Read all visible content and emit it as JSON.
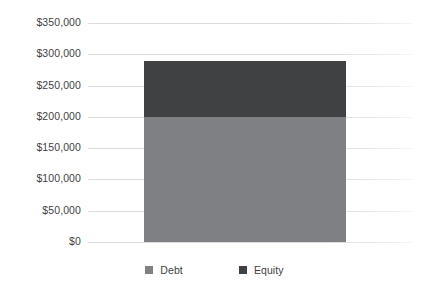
{
  "chart_data": {
    "type": "bar",
    "subtype": "stacked-bar",
    "title": "",
    "xlabel": "",
    "ylabel": "",
    "categories": [
      ""
    ],
    "series": [
      {
        "name": "Debt",
        "values": [
          200000
        ],
        "color": "#7e8083"
      },
      {
        "name": "Equity",
        "values": [
          89000
        ],
        "color": "#3f4143"
      }
    ],
    "total": 289000,
    "ylim": [
      0,
      350000
    ],
    "yticks": [
      0,
      50000,
      100000,
      150000,
      200000,
      250000,
      300000,
      350000
    ],
    "ytick_labels": [
      "$0",
      "$50,000",
      "$100,000",
      "$150,000",
      "$200,000",
      "$250,000",
      "$300,000",
      "$350,000"
    ],
    "grid": true,
    "legend_position": "bottom"
  },
  "axis": {
    "ticks": [
      {
        "label": "$350,000",
        "value": 350000
      },
      {
        "label": "$300,000",
        "value": 300000
      },
      {
        "label": "$250,000",
        "value": 250000
      },
      {
        "label": "$200,000",
        "value": 200000
      },
      {
        "label": "$150,000",
        "value": 150000
      },
      {
        "label": "$100,000",
        "value": 100000
      },
      {
        "label": "$50,000",
        "value": 50000
      },
      {
        "label": "$0",
        "value": 0
      }
    ]
  },
  "legend": {
    "items": [
      {
        "label": "Debt",
        "color": "#7e8083"
      },
      {
        "label": "Equity",
        "color": "#3f4143"
      }
    ]
  },
  "colors": {
    "debt": "#7e8083",
    "equity": "#3f4143",
    "gridline": "#dcdcdc",
    "text": "#3f3f3f",
    "background": "#ffffff"
  }
}
